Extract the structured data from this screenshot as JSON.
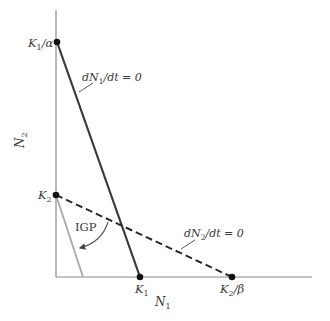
{
  "diagram": {
    "axes": {
      "x_label": "N",
      "x_label_sub": "1",
      "y_label": "N",
      "y_label_sub": "2"
    },
    "points": {
      "k1_over_alpha": {
        "main": "K",
        "sub": "1",
        "suffix": "/α"
      },
      "k2": {
        "main": "K",
        "sub": "2"
      },
      "k1": {
        "main": "K",
        "sub": "1"
      },
      "k2_over_beta": {
        "main": "K",
        "sub": "2",
        "suffix": "/β"
      }
    },
    "isoclines": {
      "n1": {
        "prefix": "dN",
        "sub": "1",
        "suffix": "/dt = 0",
        "style": "solid"
      },
      "n2": {
        "prefix": "dN",
        "sub": "2",
        "suffix": "/dt = 0",
        "style": "dashed"
      }
    },
    "annotation": {
      "igp": "IGP"
    },
    "colors": {
      "axis": "#8a8a8a",
      "n1_isocline": "#3a3a3a",
      "n2_isocline": "#2a2a2a",
      "igp_line": "#a8a8a8",
      "point": "#111111"
    }
  }
}
